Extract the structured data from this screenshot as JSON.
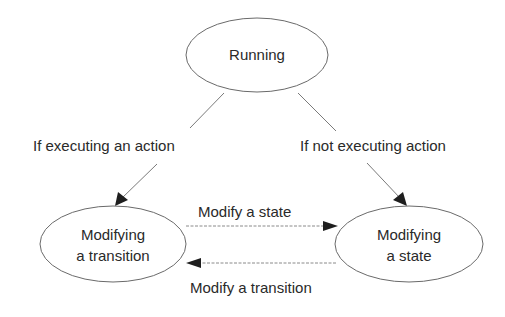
{
  "diagram": {
    "type": "state-transition",
    "nodes": [
      {
        "id": "running",
        "lines": [
          "Running"
        ]
      },
      {
        "id": "modifying-transition",
        "lines": [
          "Modifying",
          "a transition"
        ]
      },
      {
        "id": "modifying-state",
        "lines": [
          "Modifying",
          "a state"
        ]
      }
    ],
    "edges": [
      {
        "from": "running",
        "to": "modifying-transition",
        "label": "If executing an action",
        "style": "solid"
      },
      {
        "from": "running",
        "to": "modifying-state",
        "label": "If not executing action",
        "style": "solid"
      },
      {
        "from": "modifying-transition",
        "to": "modifying-state",
        "label": "Modify a state",
        "style": "dashed"
      },
      {
        "from": "modifying-state",
        "to": "modifying-transition",
        "label": "Modify a transition",
        "style": "dashed"
      }
    ],
    "colors": {
      "background": "#ffffff",
      "stroke": "#6a6a6a",
      "text": "#2a2a2a",
      "arrowhead": "#1e1e1e"
    }
  }
}
